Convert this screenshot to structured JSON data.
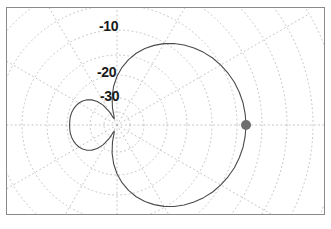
{
  "figure": {
    "type": "polar-radiation-pattern",
    "border_color": "#8a8a8a",
    "background": "#ffffff"
  },
  "grid": {
    "color": "#b9b9b9",
    "style": "dotted",
    "center_x": 110,
    "center_y": 117,
    "ring_labels": [
      {
        "name": "ring-label-minus-10",
        "text": "-10",
        "value": -10,
        "radius_px": 95
      },
      {
        "name": "ring-label-minus-20",
        "text": "-20",
        "value": -20,
        "radius_px": 50
      },
      {
        "name": "ring-label-minus-30",
        "text": "-30",
        "value": -30,
        "radius_px": 27
      }
    ],
    "radial_spokes_deg": [
      0,
      30,
      60,
      90,
      120,
      150,
      180,
      210,
      240,
      270,
      300,
      330
    ],
    "extra_ring_radii_px": [
      13,
      70,
      120,
      145,
      170,
      195,
      220
    ]
  },
  "marker": {
    "name": "peak-marker",
    "color": "#6e6e6e",
    "x": 300,
    "y": 117,
    "radius_px": 5,
    "angle_deg": 0,
    "value_db": 0
  },
  "chart_data": {
    "type": "line",
    "title": "",
    "subtitle": "",
    "xlabel": "",
    "ylabel": "",
    "projection": "polar",
    "r_unit": "dB",
    "rlim": [
      -40,
      0
    ],
    "rticks": [
      -10,
      -20,
      -30
    ],
    "grid": true,
    "legend": null,
    "annotations": [
      "-10",
      "-20",
      "-30"
    ],
    "series": [
      {
        "name": "radiation-pattern",
        "color": "#4a4a4a",
        "closed": true,
        "theta_deg": [
          0,
          5,
          10,
          15,
          20,
          25,
          30,
          35,
          40,
          45,
          50,
          55,
          60,
          65,
          70,
          75,
          80,
          85,
          90,
          95,
          100,
          105,
          110,
          115,
          120,
          125,
          130,
          135,
          140,
          145,
          150,
          155,
          160,
          165,
          170,
          175,
          180,
          185,
          190,
          195,
          200,
          205,
          210,
          215,
          220,
          225,
          230,
          235,
          240,
          245,
          250,
          255,
          260,
          265,
          270,
          275,
          280,
          285,
          290,
          295,
          300,
          305,
          310,
          315,
          320,
          325,
          330,
          335,
          340,
          345,
          350,
          355
        ],
        "r_db": [
          0.0,
          -0.1,
          -0.3,
          -0.7,
          -1.2,
          -1.9,
          -2.7,
          -3.6,
          -4.7,
          -5.9,
          -7.2,
          -8.7,
          -10.3,
          -12.1,
          -14.0,
          -16.1,
          -18.4,
          -20.9,
          -23.6,
          -26.5,
          -29.6,
          -32.8,
          -35.5,
          -36.0,
          -33.5,
          -30.8,
          -28.9,
          -27.5,
          -26.4,
          -25.6,
          -25.0,
          -24.6,
          -24.3,
          -24.1,
          -24.0,
          -24.0,
          -24.0,
          -24.0,
          -24.0,
          -24.1,
          -24.3,
          -24.6,
          -25.0,
          -25.6,
          -26.4,
          -27.5,
          -28.9,
          -30.8,
          -33.5,
          -36.0,
          -35.5,
          -32.8,
          -29.6,
          -26.5,
          -23.6,
          -20.9,
          -18.4,
          -16.1,
          -14.0,
          -12.1,
          -10.3,
          -8.7,
          -7.2,
          -5.9,
          -4.7,
          -3.6,
          -2.7,
          -1.9,
          -1.2,
          -0.7,
          -0.3,
          -0.1
        ]
      }
    ],
    "markers": [
      {
        "name": "peak-marker",
        "theta_deg": 0,
        "r_db": 0
      }
    ]
  }
}
